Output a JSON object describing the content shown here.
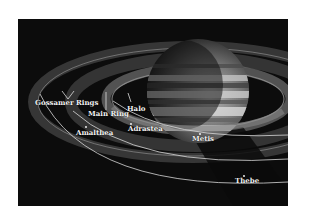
{
  "diagram": {
    "labels": {
      "gossamer_rings": "Gossamer Rings",
      "main_ring": "Main Ring",
      "halo": "Halo",
      "amalthea": "Amalthea",
      "adrastea": "Adrastea",
      "metis": "Metis",
      "thebe": "Thebe"
    },
    "colors": {
      "background": "#0c0c0c",
      "ring": "#8a8a8a",
      "orbit": "#d8d8d8",
      "label": "#f2f2f2"
    }
  }
}
